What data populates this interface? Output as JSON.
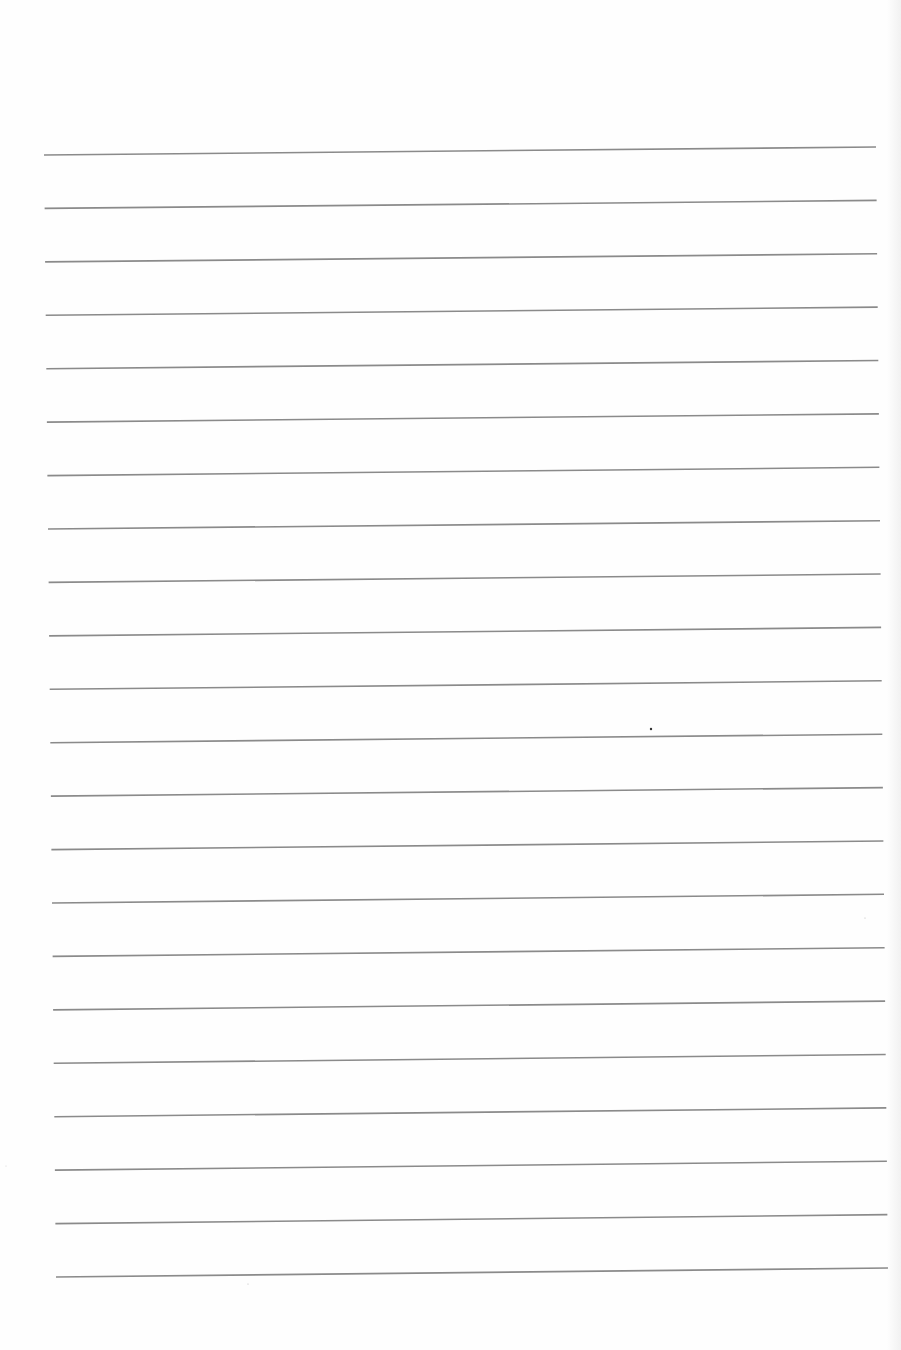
{
  "page": {
    "type": "blank ruled paper",
    "background": "#fefefe",
    "line_color": "#8a8a8a",
    "line_width": 1.6,
    "line_count": 22,
    "first_line": {
      "x1": 44,
      "y1": 155,
      "x2": 876,
      "y2": 147
    },
    "last_line": {
      "x1": 56,
      "y1": 1277,
      "x2": 888,
      "y2": 1268
    },
    "specks": [
      {
        "x": 651,
        "y": 729,
        "r": 1.2,
        "color": "#333333"
      },
      {
        "x": 865,
        "y": 918,
        "r": 0.6,
        "color": "#bbbbbb"
      },
      {
        "x": 248,
        "y": 1284,
        "r": 0.6,
        "color": "#bbbbbb"
      },
      {
        "x": 6,
        "y": 1166,
        "r": 0.5,
        "color": "#cccccc"
      }
    ]
  }
}
